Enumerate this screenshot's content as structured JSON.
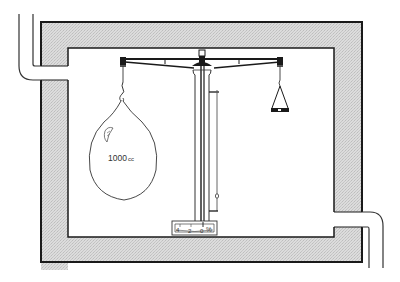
{
  "diagram": {
    "type": "apparatus-schematic",
    "colors": {
      "background": "#ffffff",
      "wall_fill": "#d6d6d6",
      "line": "#1a1a1a",
      "thin_line": "#555555"
    },
    "flask": {
      "label": "1000cc",
      "label_number": "1000",
      "label_unit": "cc"
    },
    "scale_box": {
      "ticks": [
        "4",
        "2",
        "0"
      ],
      "unit": "%"
    },
    "parts": [
      "chamber-wall",
      "inlet-pipe",
      "outlet-pipe",
      "balance-beam",
      "central-column",
      "flask",
      "counterweight-pan",
      "indicator-rod",
      "scale-box"
    ]
  }
}
